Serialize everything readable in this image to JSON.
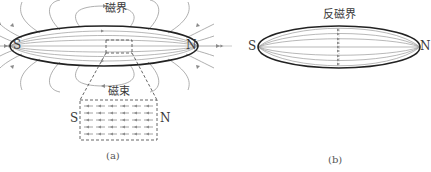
{
  "figure_a": {
    "field_label": "磁界",
    "flux_label": "磁束",
    "pole_left": "S",
    "pole_right": "N",
    "inset_pole_left": "S",
    "inset_pole_right": "N",
    "caption": "(a)"
  },
  "figure_b": {
    "field_label": "反磁界",
    "pole_left": "S",
    "pole_right": "N",
    "caption": "(b)"
  },
  "colors": {
    "outline": "#222222",
    "field_line": "#8a8a8a",
    "dashed": "#555555",
    "text": "#3a3a3a"
  }
}
